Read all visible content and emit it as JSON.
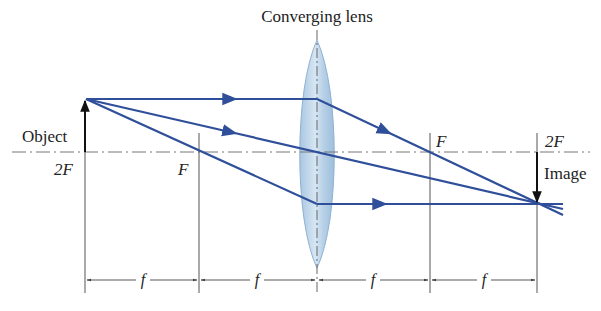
{
  "title": "Converging lens",
  "labels": {
    "object": "Object",
    "image": "Image",
    "left_2f": "2F",
    "left_f": "F",
    "right_f": "F",
    "right_2f": "2F",
    "dim_f": "f"
  },
  "dimensions": [
    "f",
    "f",
    "f",
    "f"
  ],
  "colors": {
    "ray": "#2f4f9a",
    "lens_fill": "#b9d3e8",
    "lens_edge": "#8fb2d3",
    "axis": "#777777",
    "arrow": "#111111"
  },
  "geometry": {
    "axis_y": 152,
    "object_x": 85,
    "lens_x": 317,
    "left_f_x": 199,
    "right_f_x": 430,
    "right_2f_x": 537
  }
}
